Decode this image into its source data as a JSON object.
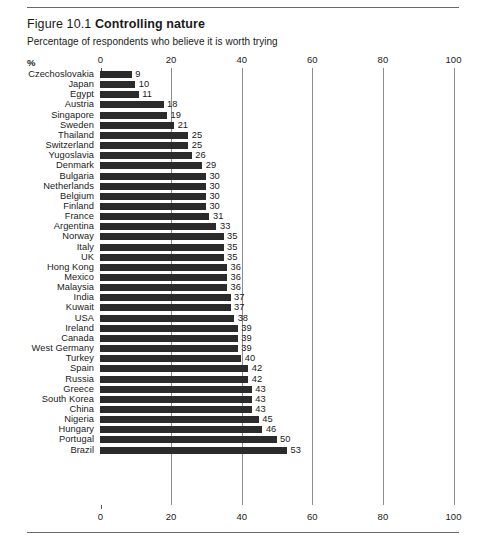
{
  "figure": {
    "number": "Figure 10.1",
    "title": "Controlling nature",
    "subtitle": "Percentage of respondents who believe it is worth trying",
    "percent_symbol": "%"
  },
  "chart_data": {
    "type": "bar",
    "orientation": "horizontal",
    "title": "Controlling nature",
    "subtitle": "Percentage of respondents who believe it is worth trying",
    "xlabel": "%",
    "ylabel": "",
    "xlim": [
      0,
      100
    ],
    "xticks": [
      0,
      20,
      40,
      60,
      80,
      100
    ],
    "xtick_labels": [
      "0",
      "20",
      "40",
      "60",
      "80",
      "100"
    ],
    "grid": "vertical gridlines at 20, 40, 60, 80, 100",
    "gridlines": [
      20,
      40,
      60,
      80,
      100
    ],
    "axis_positions": "top and bottom",
    "legend": "none",
    "bar_color": "#2b2b2b",
    "data_labels": true,
    "categories": [
      "Czechoslovakia",
      "Japan",
      "Egypt",
      "Austria",
      "Singapore",
      "Sweden",
      "Thailand",
      "Switzerland",
      "Yugoslavia",
      "Denmark",
      "Bulgaria",
      "Netherlands",
      "Belgium",
      "Finland",
      "France",
      "Argentina",
      "Norway",
      "Italy",
      "UK",
      "Hong Kong",
      "Mexico",
      "Malaysia",
      "India",
      "Kuwait",
      "USA",
      "Ireland",
      "Canada",
      "West Germany",
      "Turkey",
      "Spain",
      "Russia",
      "Greece",
      "South Korea",
      "China",
      "Nigeria",
      "Hungary",
      "Portugal",
      "Brazil"
    ],
    "values": [
      9,
      10,
      11,
      18,
      19,
      21,
      25,
      25,
      26,
      29,
      30,
      30,
      30,
      30,
      31,
      33,
      35,
      35,
      35,
      36,
      36,
      36,
      37,
      37,
      38,
      39,
      39,
      39,
      40,
      42,
      42,
      43,
      43,
      43,
      45,
      46,
      50,
      53
    ]
  }
}
